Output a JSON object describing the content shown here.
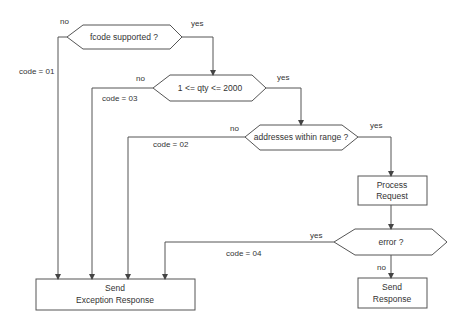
{
  "diagram": {
    "colors": {
      "stroke": "#555555",
      "text": "#333333",
      "background": "#ffffff"
    },
    "nodes": {
      "fcode": {
        "text": "fcode supported ?",
        "shape": "hexagon"
      },
      "qty": {
        "text": "1 <= qty <= 2000",
        "shape": "hexagon"
      },
      "addr": {
        "text": "addresses within range ?",
        "shape": "hexagon"
      },
      "process": {
        "line1": "Process",
        "line2": "Request",
        "shape": "rectangle"
      },
      "error": {
        "text": "error ?",
        "shape": "hexagon"
      },
      "send_response": {
        "line1": "Send",
        "line2": "Response",
        "shape": "rectangle"
      },
      "send_exception": {
        "line1": "Send",
        "line2": "Exception Response",
        "shape": "rectangle"
      }
    },
    "edges": {
      "fcode_no": "no",
      "fcode_yes": "yes",
      "code01": "code = 01",
      "qty_no": "no",
      "qty_yes": "yes",
      "code03": "code = 03",
      "addr_no": "no",
      "addr_yes": "yes",
      "code02": "code = 02",
      "error_yes": "yes",
      "error_no": "no",
      "code04": "code = 04"
    }
  }
}
